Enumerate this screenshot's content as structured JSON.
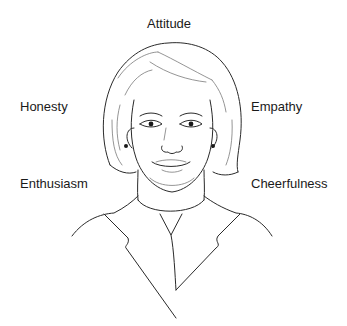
{
  "figure": {
    "labels": {
      "top": "Attitude",
      "upper_left": "Honesty",
      "upper_right": "Empathy",
      "lower_left": "Enthusiasm",
      "lower_right": "Cheerfulness"
    },
    "colors": {
      "background": "#ffffff",
      "line": "#2a2a2a",
      "text": "#1a1a1a"
    }
  }
}
